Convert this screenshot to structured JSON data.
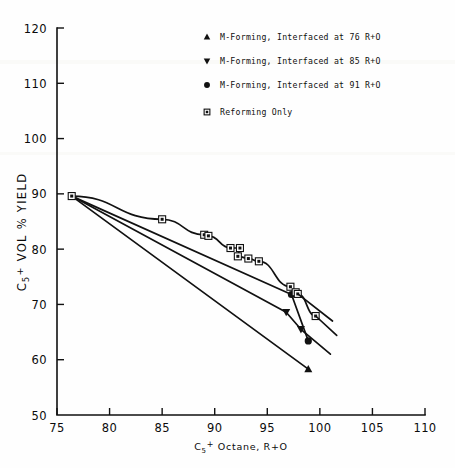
{
  "chart_data": {
    "type": "scatter",
    "title": "",
    "xlabel": "C5+ Octane, R+O",
    "ylabel": "C5+ VOL % YIELD",
    "xlim": [
      75,
      110
    ],
    "ylim": [
      50,
      120
    ],
    "xticks": [
      "75",
      "80",
      "85",
      "90",
      "95",
      "100",
      "105",
      "110"
    ],
    "yticks": [
      "50",
      "60",
      "70",
      "80",
      "90",
      "100",
      "110",
      "120"
    ],
    "xtick_values": [
      75,
      80,
      85,
      90,
      95,
      100,
      105,
      110
    ],
    "ytick_values": [
      50,
      60,
      70,
      80,
      90,
      100,
      110,
      120
    ],
    "grid": false,
    "legend_position": "upper-right",
    "series": [
      {
        "name": "M-Forming, Interfaced at 76 R+O",
        "marker": "triangle-up",
        "points": [
          {
            "x": 76.4,
            "y": 89.6
          },
          {
            "x": 98.9,
            "y": 58.3
          }
        ]
      },
      {
        "name": "M-Forming, Interfaced at 85 R+O",
        "marker": "triangle-down",
        "points": [
          {
            "x": 76.4,
            "y": 89.6
          },
          {
            "x": 96.8,
            "y": 68.6
          },
          {
            "x": 98.2,
            "y": 65.5
          }
        ]
      },
      {
        "name": "M-Forming, Interfaced at 91 R+O",
        "marker": "circle",
        "points": [
          {
            "x": 76.4,
            "y": 89.6
          },
          {
            "x": 97.3,
            "y": 71.8
          },
          {
            "x": 98.9,
            "y": 63.4
          }
        ]
      },
      {
        "name": "Reforming Only",
        "marker": "square-dot",
        "points": [
          {
            "x": 76.4,
            "y": 89.6
          },
          {
            "x": 85.0,
            "y": 85.4
          },
          {
            "x": 89.0,
            "y": 82.6
          },
          {
            "x": 89.4,
            "y": 82.4
          },
          {
            "x": 91.5,
            "y": 80.2
          },
          {
            "x": 92.4,
            "y": 80.2
          },
          {
            "x": 92.2,
            "y": 78.7
          },
          {
            "x": 93.2,
            "y": 78.3
          },
          {
            "x": 94.2,
            "y": 77.8
          },
          {
            "x": 97.2,
            "y": 73.2
          },
          {
            "x": 97.7,
            "y": 72.2
          },
          {
            "x": 97.9,
            "y": 71.9
          },
          {
            "x": 99.6,
            "y": 67.9
          }
        ]
      }
    ]
  },
  "legend": {
    "entries": [
      {
        "marker": "triangle-up",
        "label": "M-Forming, Interfaced at 76 R+O"
      },
      {
        "marker": "triangle-down",
        "label": "M-Forming, Interfaced at 85 R+O"
      },
      {
        "marker": "circle",
        "label": "M-Forming, Interfaced at 91 R+O"
      },
      {
        "marker": "square-dot",
        "label": "Reforming Only"
      }
    ]
  },
  "axes": {
    "x_title_main": "C",
    "x_title_sub": "5",
    "x_title_sup": "+",
    "x_title_rest": " Octane, R+O",
    "y_title_main": "C",
    "y_title_sub": "5",
    "y_title_sup": "+",
    "y_title_rest": " VOL % YIELD"
  },
  "colors": {
    "ink": "#111111",
    "paper": "#fefefe"
  }
}
